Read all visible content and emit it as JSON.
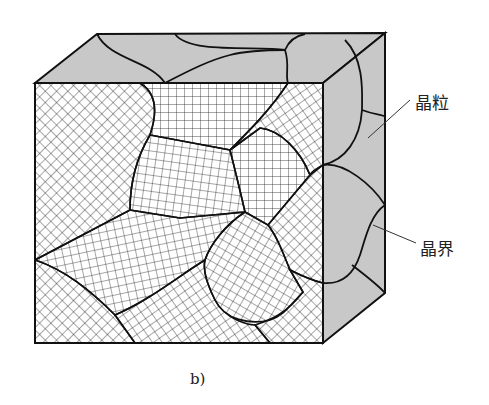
{
  "figure": {
    "caption": "b)",
    "labels": {
      "grain": "晶粒",
      "grain_boundary": "晶界"
    },
    "colors": {
      "face_fill": "#c8c8c8",
      "outline": "#111111",
      "hatch": "#222222",
      "background": "#ffffff"
    }
  }
}
